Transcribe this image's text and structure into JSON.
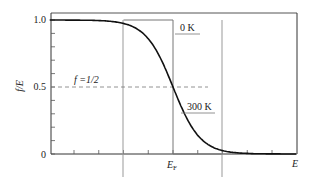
{
  "chart_data": {
    "type": "line",
    "title": "",
    "xlabel": "E",
    "ylabel": "f/E",
    "ylim": [
      0,
      1.0
    ],
    "yticks": [
      0,
      0.5,
      1.0
    ],
    "ytick_labels": [
      "0",
      "0.5",
      "1.0"
    ],
    "y_minor_step": 0.1,
    "x_tick_labels": [
      {
        "label": "E",
        "sub": "F",
        "at": "E_F"
      }
    ],
    "grid": false,
    "legend": "none",
    "reference_lines": {
      "horizontal": {
        "y": 0.5,
        "style": "dashed",
        "label": "f =1/2"
      },
      "vertical": [
        "E_F - 2",
        "E_F + 2"
      ]
    },
    "series": [
      {
        "name": "0 K",
        "style": "thin step",
        "description": "Step function: f=1 for E<E_F, f=0 for E>E_F",
        "x": [
          -2,
          0,
          0,
          2
        ],
        "y": [
          1,
          1,
          0,
          0
        ]
      },
      {
        "name": "300 K",
        "style": "bold smooth",
        "description": "Fermi-Dirac distribution 1/(exp((E-E_F)/kT)+1)",
        "x": [
          -5,
          -2,
          -1.5,
          -1,
          -0.5,
          0,
          0.5,
          1,
          1.5,
          2,
          2.5,
          3,
          5
        ],
        "y": [
          1.0,
          0.995,
          0.98,
          0.93,
          0.76,
          0.5,
          0.24,
          0.07,
          0.02,
          0.005,
          0.001,
          0.0,
          0.0
        ]
      }
    ],
    "annotations": [
      {
        "text": "0 K",
        "target": "0 K curve"
      },
      {
        "text": "300 K",
        "target": "300 K curve"
      },
      {
        "text": "f =1/2",
        "target": "dashed line at f=0.5"
      }
    ]
  },
  "labels": {
    "y_axis": "f/E",
    "x_axis": "E",
    "ef_main": "E",
    "ef_sub": "F",
    "half": "f =1/2",
    "zero_k": "0 K",
    "room_k": "300 K",
    "y0": "0",
    "y05": "0.5",
    "y1": "1.0"
  },
  "colors": {
    "axis": "#333333",
    "curve": "#111111",
    "guide": "#999999",
    "dash": "#777777"
  }
}
